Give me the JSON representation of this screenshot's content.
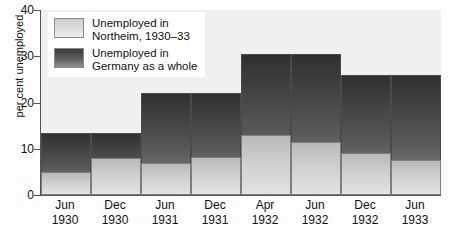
{
  "chart_data": {
    "type": "bar",
    "title": "",
    "xlabel": "",
    "ylabel": "per cent unemployed",
    "ylim": [
      0,
      40
    ],
    "yticks": [
      0,
      10,
      20,
      30,
      40
    ],
    "grid": false,
    "legend_position": "top-left",
    "categories": [
      "Jun 1930",
      "Dec 1930",
      "Jun 1931",
      "Dec 1931",
      "Apr 1932",
      "Jun 1932",
      "Dec 1932",
      "Jun 1933"
    ],
    "category_labels": [
      {
        "month": "Jun",
        "year": "1930"
      },
      {
        "month": "Dec",
        "year": "1930"
      },
      {
        "month": "Jun",
        "year": "1931"
      },
      {
        "month": "Dec",
        "year": "1931"
      },
      {
        "month": "Apr",
        "year": "1932"
      },
      {
        "month": "Jun",
        "year": "1932"
      },
      {
        "month": "Dec",
        "year": "1932"
      },
      {
        "month": "Jun",
        "year": "1933"
      }
    ],
    "series": [
      {
        "name": "Unemployed in Germany as a whole",
        "key": "germany",
        "color": "#585858",
        "values": [
          13.5,
          13.5,
          22.0,
          22.0,
          30.4,
          30.4,
          26.0,
          26.0
        ]
      },
      {
        "name": "Unemployed in Northeim, 1930–33",
        "key": "northeim",
        "color": "#cfcfcf",
        "values": [
          5.0,
          8.0,
          7.0,
          8.3,
          13.0,
          11.5,
          9.0,
          7.5
        ]
      }
    ]
  },
  "legend": {
    "items": [
      {
        "swatch": "light",
        "line1": "Unemployed in",
        "line2": "Northeim, 1930–33"
      },
      {
        "swatch": "dark",
        "line1": "Unemployed in",
        "line2": "Germany as a whole"
      }
    ]
  },
  "axis": {
    "y_label": "per cent unemployed",
    "y_tick_0": "0",
    "y_tick_10": "10",
    "y_tick_20": "20",
    "y_tick_30": "30",
    "y_tick_40": "40"
  }
}
